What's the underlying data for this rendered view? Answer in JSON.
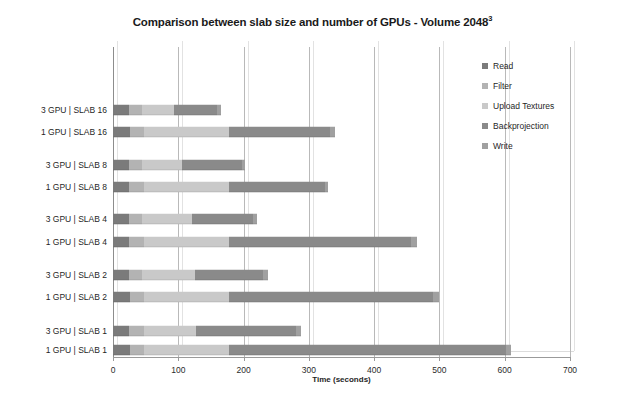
{
  "chart_data": {
    "type": "bar",
    "orientation": "horizontal",
    "stacked": true,
    "title_main": "Comparison between slab size and number of GPUs - Volume 2048",
    "title_sup": "3",
    "xlabel": "Time (seconds)",
    "ylabel": "",
    "xlim": [
      0,
      700
    ],
    "xticks": [
      0,
      100,
      200,
      300,
      400,
      500,
      600,
      700
    ],
    "xtick_labels": [
      "0",
      "100",
      "200",
      "300",
      "400",
      "500",
      "600",
      "700"
    ],
    "grid": "vertical",
    "legend_position": "right",
    "categories": [
      "1 GPU | SLAB 1",
      "3 GPU | SLAB 1",
      "1 GPU | SLAB 2",
      "3 GPU | SLAB 2",
      "1 GPU | SLAB 4",
      "3 GPU | SLAB 4",
      "1 GPU | SLAB 8",
      "3 GPU | SLAB 8",
      "1 GPU | SLAB 16",
      "3 GPU | SLAB 16"
    ],
    "series": [
      {
        "name": "Read",
        "color": "#7b7b7b",
        "values": [
          26,
          25,
          26,
          24,
          25,
          24,
          25,
          24,
          26,
          24
        ]
      },
      {
        "name": "Filter",
        "color": "#b3b3b3",
        "values": [
          22,
          22,
          22,
          21,
          22,
          21,
          22,
          21,
          22,
          21
        ]
      },
      {
        "name": "Upload Textures",
        "color": "#c9c9c9",
        "values": [
          130,
          80,
          130,
          80,
          130,
          76,
          130,
          60,
          130,
          48
        ]
      },
      {
        "name": "Backprojection",
        "color": "#8a8a8a",
        "values": [
          424,
          153,
          312,
          105,
          280,
          94,
          147,
          92,
          155,
          67
        ]
      },
      {
        "name": "Write",
        "color": "#a0a0a0",
        "values": [
          8,
          8,
          10,
          8,
          8,
          5,
          6,
          6,
          7,
          5
        ]
      }
    ],
    "totals": [
      610,
      288,
      500,
      238,
      465,
      220,
      330,
      203,
      340,
      165
    ]
  },
  "legend": {
    "items": [
      {
        "label": "Read",
        "color": "#7b7b7b"
      },
      {
        "label": "Filter",
        "color": "#b3b3b3"
      },
      {
        "label": "Upload Textures",
        "color": "#c9c9c9"
      },
      {
        "label": "Backprojection",
        "color": "#8a8a8a"
      },
      {
        "label": "Write",
        "color": "#a0a0a0"
      }
    ]
  }
}
